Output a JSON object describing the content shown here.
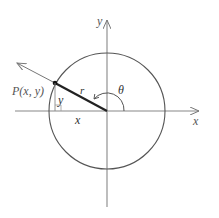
{
  "figure": {
    "axes": {
      "x_label": "x",
      "y_label": "y"
    },
    "point": {
      "label": "P(x, y)"
    },
    "segments": {
      "radius_label": "r",
      "horizontal_label": "x",
      "vertical_label": "y"
    },
    "angle": {
      "label": "θ"
    },
    "colors": {
      "axis": "#888888",
      "circle": "#555555",
      "radius_segment": "#222222",
      "ray": "#777777",
      "labels": "#555555"
    }
  }
}
